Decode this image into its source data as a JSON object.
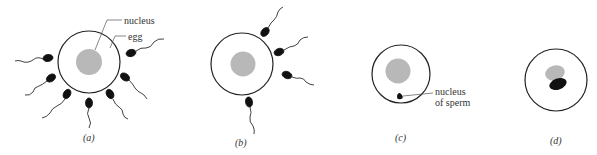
{
  "figure": {
    "panels": [
      {
        "id": "a",
        "caption": "(a)",
        "labels": {
          "nucleus": "nucleus",
          "egg": "egg"
        },
        "sperm_count": 8
      },
      {
        "id": "b",
        "caption": "(b)",
        "sperm_count": 4
      },
      {
        "id": "c",
        "caption": "(c)",
        "labels": {
          "sperm_nucleus_line1": "nucleus",
          "sperm_nucleus_line2": "of sperm"
        }
      },
      {
        "id": "d",
        "caption": "(d)"
      }
    ],
    "colors": {
      "egg_outline": "#222222",
      "nucleus": "#b8b8b8",
      "sperm": "#111111"
    }
  }
}
